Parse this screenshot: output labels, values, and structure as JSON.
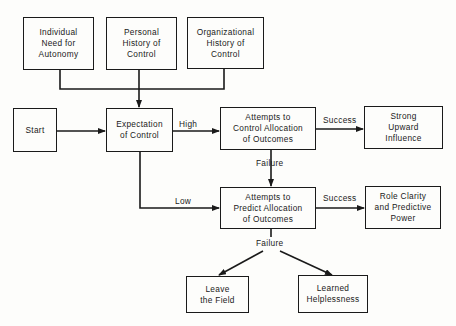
{
  "diagram": {
    "nodes": {
      "need_autonomy": "Individual\nNeed for\nAutonomy",
      "personal_history": "Personal\nHistory of\nControl",
      "org_history": "Organizational\nHistory of\nControl",
      "start": "Start",
      "expectation": "Expectation\nof Control",
      "control_attempts": "Attempts to\nControl Allocation\nof Outcomes",
      "strong_influence": "Strong\nUpward\nInfluence",
      "predict_attempts": "Attempts to\nPredict Allocation\nof Outcomes",
      "role_clarity": "Role Clarity\nand Predictive\nPower",
      "leave_field": "Leave\nthe Field",
      "learned_helplessness": "Learned\nHelplessness"
    },
    "edge_labels": {
      "high": "High",
      "low": "Low",
      "success_control": "Success",
      "success_predict": "Success",
      "failure_control": "Failure",
      "failure_predict": "Failure"
    },
    "colors": {
      "line": "#1a1a1a",
      "background": "#fdfdfb"
    }
  }
}
